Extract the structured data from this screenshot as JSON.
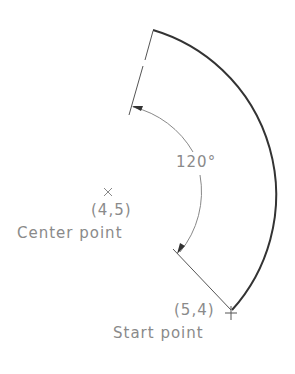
{
  "diagram": {
    "type": "arc-construction",
    "colors": {
      "arc": "#333333",
      "dimension": "#8a8a8a",
      "text": "#8a8a8a",
      "background": "#ffffff"
    },
    "angle_label": "120°",
    "center": {
      "marker": "×",
      "coord_label": "(4,5)",
      "text_label": "Center point"
    },
    "start": {
      "marker": "+",
      "coord_label": "(5,4)",
      "text_label": "Start point"
    },
    "included_angle_deg": 120
  }
}
